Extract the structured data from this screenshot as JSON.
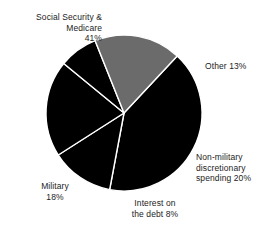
{
  "chart_data": {
    "type": "pie",
    "title": "",
    "subtitle": "",
    "xlabel": "",
    "ylabel": "",
    "legend_position": "none",
    "grid": false,
    "labels_position": "outside",
    "total_percent": 100,
    "categories": [
      "Social Security & Medicare",
      "Other",
      "Non-military discretionary spending",
      "Interest on the debt",
      "Military"
    ],
    "values": [
      41,
      13,
      20,
      8,
      18
    ],
    "colors": [
      "#000000",
      "#000000",
      "#000000",
      "#000000",
      "#6b6b6b"
    ],
    "slice_separator_color": "#ffffff",
    "slices": [
      {
        "name": "Social Security & Medicare",
        "value": 41,
        "value_label": "41%",
        "color": "#000000",
        "label_lines": [
          "Social Security &",
          "Medicare",
          "41%"
        ],
        "label_text": "Social Security &\nMedicare\n41%"
      },
      {
        "name": "Other",
        "value": 13,
        "value_label": "13%",
        "color": "#000000",
        "label_lines": [
          "Other 13%"
        ],
        "label_text": "Other 13%"
      },
      {
        "name": "Non-military discretionary spending",
        "value": 20,
        "value_label": "20%",
        "color": "#000000",
        "label_lines": [
          "Non-military",
          "discretionary",
          "spending 20%"
        ],
        "label_text": "Non-military\ndiscretionary\nspending 20%"
      },
      {
        "name": "Interest on the debt",
        "value": 8,
        "value_label": "8%",
        "color": "#000000",
        "label_lines": [
          "Interest on",
          "the debt 8%"
        ],
        "label_text": "Interest on\nthe debt 8%"
      },
      {
        "name": "Military",
        "value": 18,
        "value_label": "18%",
        "color": "#6b6b6b",
        "label_lines": [
          "Military",
          "18%"
        ],
        "label_text": "Military\n18%"
      }
    ]
  },
  "figure": {
    "background": "#ffffff",
    "center_x": 124,
    "center_y": 113,
    "radius": 78
  }
}
